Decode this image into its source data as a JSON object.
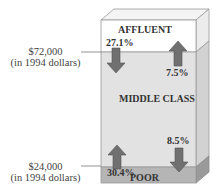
{
  "diagram": {
    "type": "income-class-block",
    "sections": [
      {
        "name": "AFFLUENT",
        "color": "#ffffff"
      },
      {
        "name": "MIDDLE CLASS",
        "color": "#e2e2e2"
      },
      {
        "name": "POOR",
        "color": "#b5b5b5"
      }
    ],
    "thresholds": [
      {
        "amount": "$72,000",
        "note": "(in 1994 dollars)"
      },
      {
        "amount": "$24,000",
        "note": "(in 1994 dollars)"
      }
    ],
    "flows": [
      {
        "label": "27.1%",
        "direction": "down",
        "from": "AFFLUENT",
        "to": "MIDDLE CLASS"
      },
      {
        "label": "7.5%",
        "direction": "up",
        "from": "MIDDLE CLASS",
        "to": "AFFLUENT"
      },
      {
        "label": "30.4%",
        "direction": "up",
        "from": "POOR",
        "to": "MIDDLE CLASS"
      },
      {
        "label": "8.5%",
        "direction": "down",
        "from": "MIDDLE CLASS",
        "to": "POOR"
      }
    ],
    "arrow_color": "#6e6e6e"
  }
}
